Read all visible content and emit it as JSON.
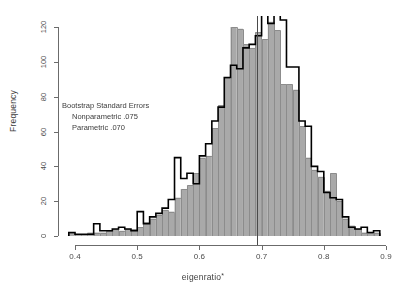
{
  "figure": {
    "background": "#ffffff"
  },
  "annotation": {
    "title": "Bootstrap Standard Errors",
    "line1": "Nonparametric .075",
    "line2": "Parametric .070"
  },
  "axes": {
    "x_title": "eigenratio",
    "x_title_superscript": "*",
    "y_title": "Frequency",
    "x_ticks": [
      "0.4",
      "0.5",
      "0.6",
      "0.7",
      "0.8",
      "0.9"
    ],
    "y_ticks": [
      "0",
      "20",
      "40",
      "60",
      "80",
      "100",
      "120"
    ]
  },
  "chart_data": {
    "type": "bar",
    "title": "",
    "subtitle": "",
    "xlabel": "eigenratio*",
    "ylabel": "Frequency",
    "xlim": [
      0.385,
      0.9
    ],
    "ylim": [
      0,
      128
    ],
    "grid": false,
    "legend": "none",
    "bin_width": 0.01,
    "annotations": [
      {
        "text": "Bootstrap Standard Errors",
        "x": 0.445,
        "y": 78
      },
      {
        "text": "Nonparametric .075",
        "x": 0.462,
        "y": 66
      },
      {
        "text": "Parametric .070",
        "x": 0.462,
        "y": 59
      },
      {
        "type": "vline",
        "x": 0.693,
        "label": "observed eigenratio"
      }
    ],
    "series": [
      {
        "name": "Parametric",
        "style": "filled-bars",
        "color": "#a9a9a9",
        "edge_color": "#8c8c8c",
        "bin_starts": [
          0.39,
          0.4,
          0.41,
          0.42,
          0.43,
          0.44,
          0.45,
          0.46,
          0.47,
          0.48,
          0.49,
          0.5,
          0.51,
          0.52,
          0.53,
          0.54,
          0.55,
          0.56,
          0.57,
          0.58,
          0.59,
          0.6,
          0.61,
          0.62,
          0.63,
          0.64,
          0.65,
          0.66,
          0.67,
          0.68,
          0.69,
          0.7,
          0.71,
          0.72,
          0.73,
          0.74,
          0.75,
          0.76,
          0.77,
          0.78,
          0.79,
          0.8,
          0.81,
          0.82,
          0.83,
          0.84,
          0.85,
          0.86,
          0.87,
          0.88
        ],
        "values": [
          2,
          1,
          1,
          2,
          2,
          2,
          3,
          4,
          3,
          4,
          4,
          5,
          8,
          10,
          12,
          15,
          14,
          22,
          27,
          29,
          36,
          45,
          46,
          62,
          75,
          91,
          120,
          119,
          110,
          108,
          117,
          113,
          123,
          118,
          87,
          87,
          84,
          63,
          45,
          38,
          34,
          26,
          36,
          20,
          10,
          6,
          4,
          2,
          2,
          2
        ]
      },
      {
        "name": "Nonparametric",
        "style": "step-outline",
        "color": "#000000",
        "bin_starts": [
          0.39,
          0.4,
          0.41,
          0.42,
          0.43,
          0.44,
          0.45,
          0.46,
          0.47,
          0.48,
          0.49,
          0.5,
          0.51,
          0.52,
          0.53,
          0.54,
          0.55,
          0.56,
          0.57,
          0.58,
          0.59,
          0.6,
          0.61,
          0.62,
          0.63,
          0.64,
          0.65,
          0.66,
          0.67,
          0.68,
          0.69,
          0.7,
          0.71,
          0.72,
          0.73,
          0.74,
          0.75,
          0.76,
          0.77,
          0.78,
          0.79,
          0.8,
          0.81,
          0.82,
          0.83,
          0.84,
          0.85,
          0.86,
          0.87,
          0.88
        ],
        "values": [
          2,
          1,
          1,
          1,
          7,
          3,
          3,
          4,
          5,
          4,
          3,
          14,
          7,
          11,
          13,
          16,
          21,
          45,
          33,
          36,
          30,
          46,
          53,
          66,
          74,
          91,
          98,
          96,
          108,
          110,
          115,
          127,
          122,
          127,
          124,
          97,
          97,
          66,
          63,
          40,
          37,
          25,
          22,
          21,
          11,
          5,
          4,
          5,
          2,
          3
        ]
      }
    ]
  }
}
